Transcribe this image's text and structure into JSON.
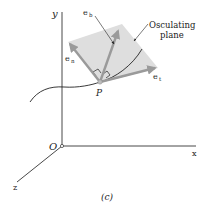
{
  "figure": {
    "caption": "(c)",
    "axes": {
      "x_label": "x",
      "y_label": "y",
      "z_label": "z",
      "origin_label": "O"
    },
    "point_label": "P",
    "plane_label_line1": "Osculating",
    "plane_label_line2": "plane",
    "vectors": {
      "binormal": {
        "base": "e",
        "sub": "b"
      },
      "normal": {
        "base": "e",
        "sub": "n"
      },
      "tangent": {
        "base": "e",
        "sub": "t"
      }
    },
    "colors": {
      "plane": "#d9d9d9",
      "arrow": "#9a9a9a",
      "axis": "#333333",
      "curve": "#222222"
    }
  }
}
